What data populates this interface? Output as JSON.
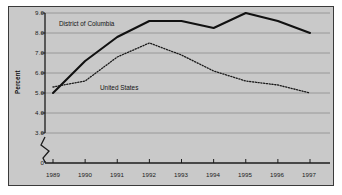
{
  "chart_data": {
    "type": "line",
    "title": "",
    "subtitle": "",
    "xlabel": "",
    "ylabel": "Percent",
    "x": [
      1989,
      1990,
      1991,
      1992,
      1993,
      1994,
      1995,
      1996,
      1997
    ],
    "xtick_labels": [
      "1989",
      "1990",
      "1991",
      "1992",
      "1993",
      "1994",
      "1995",
      "1996",
      "1997"
    ],
    "ytick_labels": [
      "9.0",
      "8.0",
      "7.0",
      "6.0",
      "5.0",
      "4.0",
      "3.0",
      "0"
    ],
    "ytick_values": [
      9.0,
      8.0,
      7.0,
      6.0,
      5.0,
      4.0,
      3.0,
      0.0
    ],
    "ylim": [
      0,
      9.0
    ],
    "xlim": [
      1988.6,
      1997.6
    ],
    "axis_break": true,
    "axis_break_between": [
      0.0,
      3.0
    ],
    "grid": true,
    "grid_axis": "y",
    "legend": "inline-annotations",
    "series": [
      {
        "name": "District of Columbia",
        "style": "solid",
        "color": "#111111",
        "width": 2.1,
        "values": [
          5.0,
          6.6,
          7.8,
          8.6,
          8.6,
          8.25,
          9.0,
          8.6,
          8.0
        ]
      },
      {
        "name": "United States",
        "style": "dotted",
        "color": "#1a1a1a",
        "width": 1.3,
        "values": [
          5.3,
          5.6,
          6.8,
          7.5,
          6.9,
          6.1,
          5.6,
          5.4,
          5.0
        ]
      }
    ],
    "annotations": [
      {
        "text": "District of Columbia",
        "series": "District of Columbia"
      },
      {
        "text": "United States",
        "series": "United States"
      }
    ]
  },
  "style": {
    "plot_background": "#c9c9c9",
    "page_background": "#ffffff",
    "border_color": "#3a3a3a",
    "gridline_color": "#8d8d8d",
    "axis_color": "#1b1b1b"
  }
}
